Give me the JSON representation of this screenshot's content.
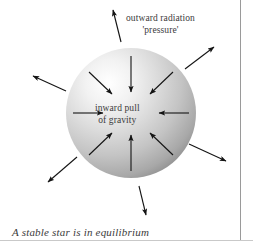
{
  "figure": {
    "title": "A stable star is in equilibrium",
    "caption": "A stable star is in equilibrium",
    "background_color": "#ffffff",
    "text_color": "#3b3b3b",
    "arrow_color": "#1a1a1a",
    "rule_color": "#9a9a9a"
  },
  "labels": {
    "radiation_line1": "outward radiation",
    "radiation_line2": "'pressure'",
    "gravity_line1": "inward pull",
    "gravity_line2": "of gravity"
  },
  "diagram_data": {
    "type": "diagram",
    "subject": "stellar equilibrium",
    "star": {
      "shape": "sphere",
      "center_x": 131,
      "center_y": 113,
      "radius": 65,
      "fill": "radial-gradient",
      "highlight_color": "#ffffff",
      "mid_color": "#d2d2d2",
      "edge_color": "#8e8e8e"
    },
    "inward_arrows": {
      "count": 8,
      "label": "inward pull of gravity",
      "direction": "toward center",
      "angles_deg": [
        90,
        135,
        180,
        225,
        270,
        315,
        0,
        45
      ]
    },
    "outward_arrows": {
      "count": 6,
      "label": "outward radiation 'pressure'",
      "direction": "away from center",
      "angles_deg": [
        100,
        145,
        40,
        340,
        215,
        285
      ]
    }
  }
}
